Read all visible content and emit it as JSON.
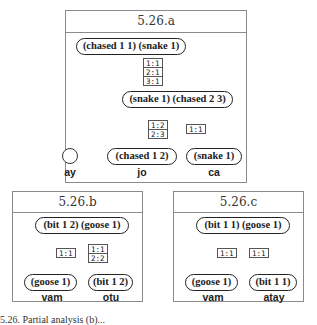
{
  "diagrams": {
    "a": {
      "title": "5.26.a",
      "root": "(chased 1 1) (snake 1)",
      "root_to_mid_alignments": [
        "1:1",
        "2:1",
        "3:1"
      ],
      "mid": "(snake 1) (chased 2 3)",
      "mid_to_jo_alignments": [
        "1:2",
        "2:3"
      ],
      "mid_to_ca_alignments": [
        "1:1"
      ],
      "leaves": [
        {
          "node": "",
          "word": "ay"
        },
        {
          "node": "(chased 1 2)",
          "word": "jo"
        },
        {
          "node": "(snake 1)",
          "word": "ca"
        }
      ]
    },
    "b": {
      "title": "5.26.b",
      "root": "(bit 1 2) (goose 1)",
      "left_alignments": [
        "1:1"
      ],
      "right_alignments": [
        "1:1",
        "2:2"
      ],
      "leaves": [
        {
          "node": "(goose 1)",
          "word": "vam"
        },
        {
          "node": "(bit 1 2)",
          "word": "otu"
        }
      ]
    },
    "c": {
      "title": "5.26.c",
      "root": "(bit 1 1) (goose 1)",
      "left_alignments": [
        "1:1"
      ],
      "right_alignments": [
        "1:1"
      ],
      "leaves": [
        {
          "node": "(goose 1)",
          "word": "vam"
        },
        {
          "node": "(bit 1 1)",
          "word": "atay"
        }
      ]
    }
  },
  "caption": "5.26. Partial analysis (b)..."
}
